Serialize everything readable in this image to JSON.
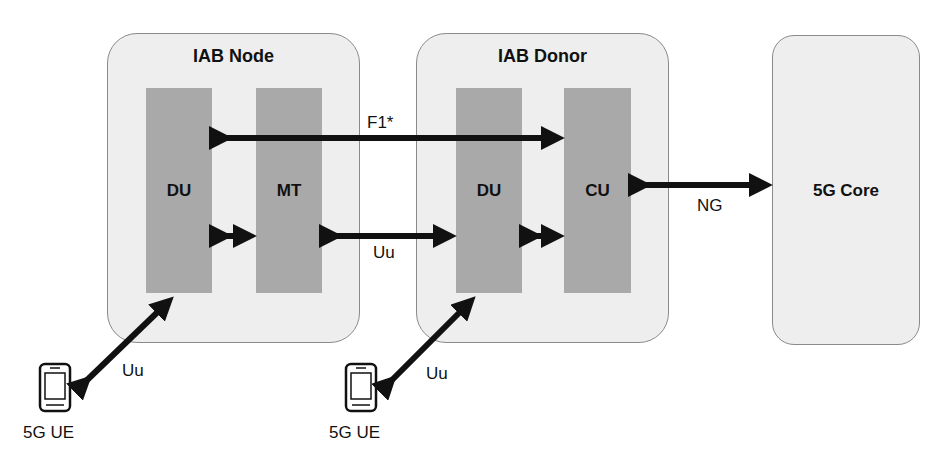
{
  "diagram": {
    "nodes": {
      "iab_node": {
        "title": "IAB Node",
        "blocks": [
          "DU",
          "MT"
        ]
      },
      "iab_donor": {
        "title": "IAB Donor",
        "blocks": [
          "DU",
          "CU"
        ]
      },
      "core": {
        "title": "5G Core"
      },
      "ue_left": {
        "label": "5G UE"
      },
      "ue_right": {
        "label": "5G UE"
      }
    },
    "links": {
      "f1": "F1*",
      "uu_backhaul": "Uu",
      "ng": "NG",
      "uu_ue_left": "Uu",
      "uu_ue_right": "Uu"
    },
    "colors": {
      "container": "#eeeeee",
      "block": "#a9a9a9",
      "arrow": "#111111"
    }
  }
}
